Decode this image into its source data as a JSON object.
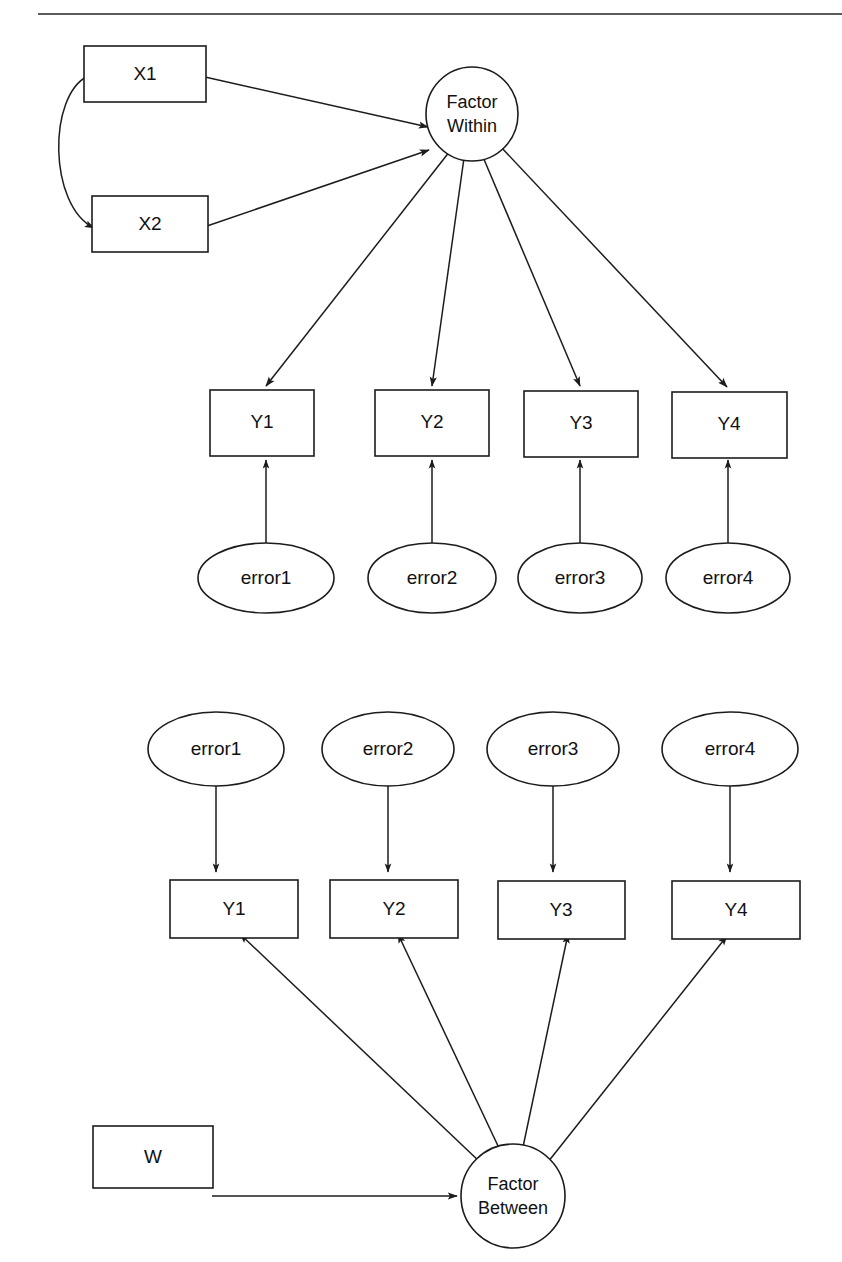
{
  "page": {
    "header_text": "",
    "background_color": "#ffffff",
    "stroke_color": "#1c1c1c",
    "rule_color": "#5b5b5b",
    "width": 842,
    "height": 1262
  },
  "diagram_title": "Two-level factor model path diagram",
  "within_model": {
    "name": "Within",
    "factor": {
      "label_line1": "Factor",
      "label_line2": "Within"
    },
    "predictors": [
      {
        "label": "X1"
      },
      {
        "label": "X2"
      }
    ],
    "indicators": [
      {
        "label": "Y1"
      },
      {
        "label": "Y2"
      },
      {
        "label": "Y3"
      },
      {
        "label": "Y4"
      }
    ],
    "errors": [
      {
        "label": "error1"
      },
      {
        "label": "error2"
      },
      {
        "label": "error3"
      },
      {
        "label": "error4"
      }
    ],
    "covariance_label": ""
  },
  "between_model": {
    "name": "Between",
    "factor": {
      "label_line1": "Factor",
      "label_line2": "Between"
    },
    "predictors": [
      {
        "label": "W"
      }
    ],
    "indicators": [
      {
        "label": "Y1"
      },
      {
        "label": "Y2"
      },
      {
        "label": "Y3"
      },
      {
        "label": "Y4"
      }
    ],
    "errors": [
      {
        "label": "error1"
      },
      {
        "label": "error2"
      },
      {
        "label": "error3"
      },
      {
        "label": "error4"
      }
    ]
  }
}
